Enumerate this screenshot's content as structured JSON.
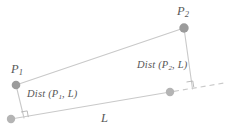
{
  "figure": {
    "colors": {
      "point_fill": "#9b9b9b",
      "point_stroke": "#8a8a8a",
      "line": "#c9c9c9",
      "dashed_line": "#c9c9c9",
      "right_angle": "#b0b0b0",
      "text": "#575757",
      "background": "#ffffff"
    },
    "labels": {
      "p1": {
        "base": "P",
        "sub": "1"
      },
      "p2": {
        "base": "P",
        "sub": "2"
      },
      "dist_p1_prefix": "Dist (P",
      "dist_p1_sub": "1",
      "dist_p1_suffix": ", L)",
      "dist_p2_prefix": "Dist (P",
      "dist_p2_sub": "2",
      "dist_p2_suffix": ", L)",
      "line_l": "L"
    },
    "geometry": {
      "point_p1": {
        "x": 16,
        "y": 85,
        "r": 4.2
      },
      "point_p2": {
        "x": 184,
        "y": 28,
        "r": 4.6
      },
      "point_l_start": {
        "x": 11,
        "y": 119,
        "r": 4.2
      },
      "point_l_end": {
        "x": 170,
        "y": 92,
        "r": 4.2
      },
      "segment_p1_p2": {
        "x1": 16,
        "y1": 85,
        "x2": 184,
        "y2": 28
      },
      "segment_line_l": {
        "x1": 11,
        "y1": 119,
        "x2": 170,
        "y2": 92
      },
      "dashed_extension": {
        "x1": 172,
        "y1": 92,
        "x2": 222,
        "y2": 84
      },
      "perpendicular_p1": {
        "x1": 16,
        "y1": 85,
        "x2": 24,
        "y2": 118
      },
      "perpendicular_p2": {
        "x1": 184,
        "y1": 28,
        "x2": 192,
        "y2": 88
      },
      "right_angle_p1": {
        "x": 22,
        "y": 111,
        "size": 6
      },
      "right_angle_p2": {
        "x": 187,
        "y": 81,
        "size": 6
      }
    }
  }
}
